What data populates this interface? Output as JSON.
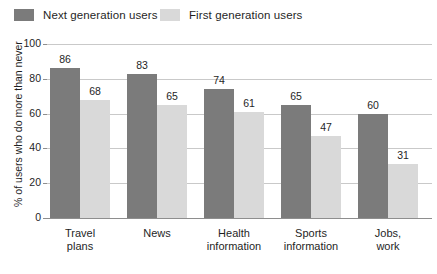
{
  "chart_data": {
    "type": "bar",
    "title": "",
    "xlabel": "",
    "ylabel": "% of users who do more than never",
    "ylim": [
      0,
      100
    ],
    "yticks": [
      0,
      20,
      40,
      60,
      80,
      100
    ],
    "grid": true,
    "legend_position": "top-left",
    "categories": [
      "Travel plans",
      "News",
      "Health information",
      "Sports information",
      "Jobs, work"
    ],
    "category_lines": [
      [
        "Travel",
        "plans"
      ],
      [
        "News",
        ""
      ],
      [
        "Health",
        "information"
      ],
      [
        "Sports",
        "information"
      ],
      [
        "Jobs,",
        "work"
      ]
    ],
    "series": [
      {
        "name": "Next generation users",
        "color": "#7b7b7b",
        "values": [
          86,
          83,
          74,
          65,
          60
        ]
      },
      {
        "name": "First generation users",
        "color": "#d9d9d9",
        "values": [
          68,
          65,
          61,
          47,
          31
        ]
      }
    ]
  },
  "legend": {
    "items": [
      {
        "label": "Next generation users",
        "swatch": "dark-swatch-icon"
      },
      {
        "label": "First generation users",
        "swatch": "light-swatch-icon"
      }
    ]
  },
  "footnote": "",
  "colors": {
    "next_generation": "#7b7b7b",
    "first_generation": "#d9d9d9",
    "gridline": "#c9c9c9",
    "axis": "#8e8e8e",
    "text": "#1f1f1f",
    "background": "#ffffff"
  }
}
